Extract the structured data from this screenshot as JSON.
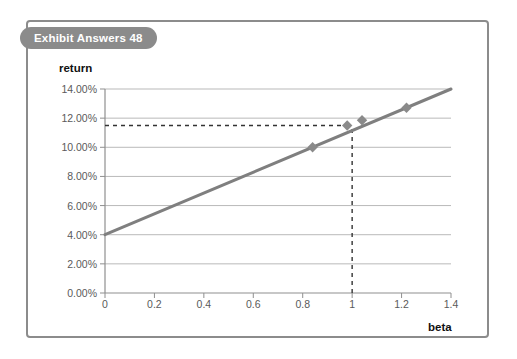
{
  "exhibit": {
    "title": "Exhibit Answers 48",
    "badge_color": "#8b8b8b",
    "frame_color": "#8c8c8c"
  },
  "chart_data": {
    "type": "line",
    "title": "Exhibit Answers 48",
    "subtitle": "",
    "xlabel": "beta",
    "ylabel": "return",
    "xlim": [
      0,
      1.4
    ],
    "ylim": [
      0,
      0.14
    ],
    "x_ticks": [
      0,
      0.2,
      0.4,
      0.6,
      0.8,
      1,
      1.2,
      1.4
    ],
    "x_tick_labels": [
      "0",
      "0.2",
      "0.4",
      "0.6",
      "0.8",
      "1",
      "1.2",
      "1.4"
    ],
    "y_ticks": [
      0,
      0.02,
      0.04,
      0.06,
      0.08,
      0.1,
      0.12,
      0.14
    ],
    "y_tick_labels": [
      "0.00%",
      "2.00%",
      "4.00%",
      "6.00%",
      "8.00%",
      "10.00%",
      "12.00%",
      "14.00%"
    ],
    "grid": "horizontal",
    "legend": "none",
    "line_color": "#7f7f7f",
    "marker_color": "#8a8a8a",
    "grid_color": "#b9b9b9",
    "series": [
      {
        "name": "Security Market Line",
        "type": "line",
        "x": [
          0,
          1.4
        ],
        "y": [
          0.04,
          0.14
        ],
        "intercept": 0.04,
        "slope": 0.0714
      },
      {
        "name": "Securities",
        "type": "scatter",
        "marker": "diamond",
        "points": [
          {
            "x": 0.84,
            "y": 0.1
          },
          {
            "x": 0.98,
            "y": 0.115
          },
          {
            "x": 1.04,
            "y": 0.1186
          },
          {
            "x": 1.22,
            "y": 0.1271
          }
        ]
      }
    ],
    "annotations": [
      {
        "type": "dashed-horizontal",
        "y": 0.115,
        "x_from": 0,
        "x_to": 1,
        "color": "#333333"
      },
      {
        "type": "dashed-vertical",
        "x": 1,
        "y_from": 0,
        "y_to": 0.115,
        "color": "#333333"
      }
    ]
  }
}
